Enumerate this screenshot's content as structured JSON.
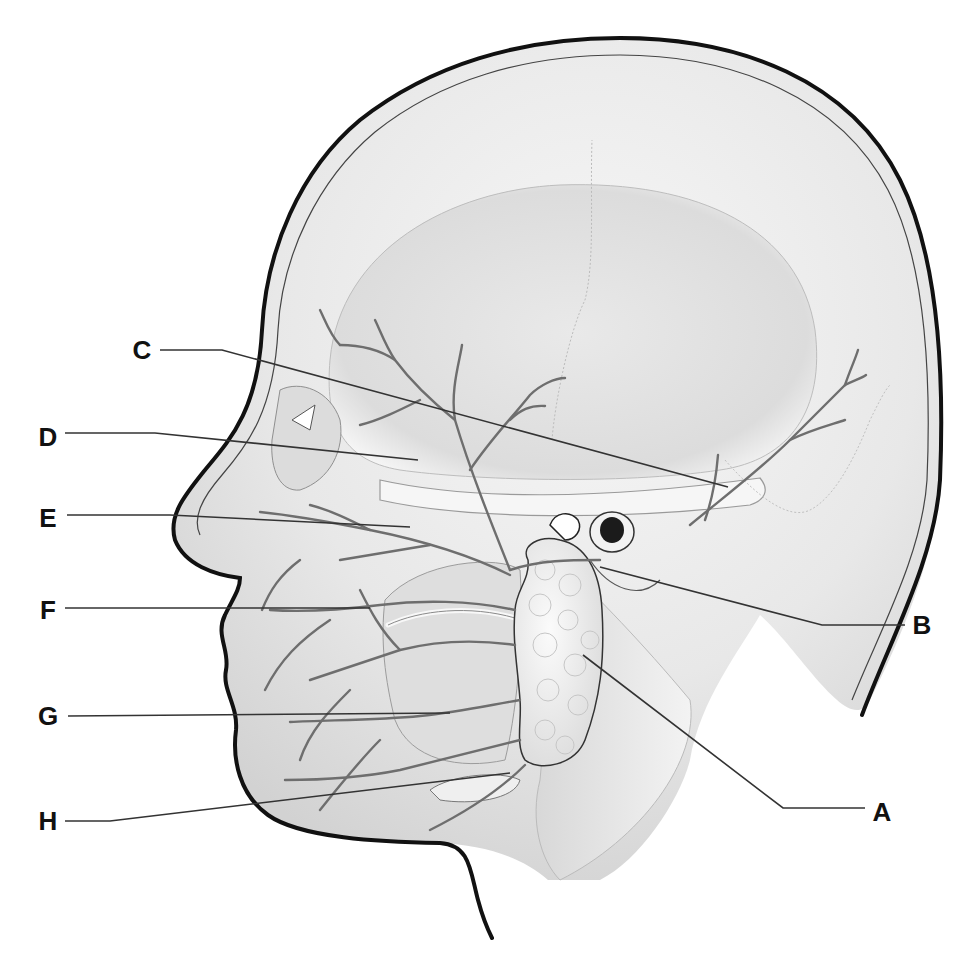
{
  "diagram": {
    "style": {
      "ink": "#111111",
      "leader": "#333333",
      "nerve": "#6e6e6e",
      "skin": "#e6e6e6",
      "gland": "#f4f4f4",
      "background": "#ffffff"
    },
    "labels": [
      {
        "id": "C",
        "text": "C",
        "x": 142,
        "y": 350,
        "leader": [
          [
            160,
            350
          ],
          [
            222,
            350
          ],
          [
            728,
            487
          ]
        ]
      },
      {
        "id": "D",
        "text": "D",
        "x": 48,
        "y": 437,
        "leader": [
          [
            65,
            433
          ],
          [
            155,
            433
          ],
          [
            418,
            460
          ]
        ]
      },
      {
        "id": "E",
        "text": "E",
        "x": 48,
        "y": 518,
        "leader": [
          [
            67,
            515
          ],
          [
            170,
            515
          ],
          [
            410,
            527
          ]
        ]
      },
      {
        "id": "F",
        "text": "F",
        "x": 48,
        "y": 610,
        "leader": [
          [
            65,
            608
          ],
          [
            370,
            608
          ]
        ]
      },
      {
        "id": "G",
        "text": "G",
        "x": 48,
        "y": 716,
        "leader": [
          [
            68,
            716
          ],
          [
            450,
            713
          ]
        ]
      },
      {
        "id": "H",
        "text": "H",
        "x": 48,
        "y": 821,
        "leader": [
          [
            65,
            821
          ],
          [
            110,
            821
          ],
          [
            510,
            773
          ]
        ]
      },
      {
        "id": "B",
        "text": "B",
        "x": 922,
        "y": 625,
        "leader": [
          [
            905,
            625
          ],
          [
            822,
            625
          ],
          [
            600,
            567
          ]
        ]
      },
      {
        "id": "A",
        "text": "A",
        "x": 882,
        "y": 812,
        "leader": [
          [
            865,
            808
          ],
          [
            783,
            808
          ],
          [
            583,
            655
          ]
        ]
      }
    ]
  }
}
